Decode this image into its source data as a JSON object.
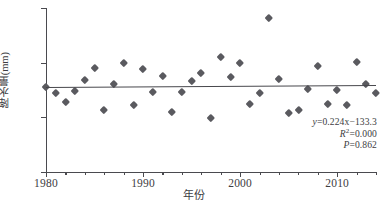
{
  "chart_data": {
    "type": "scatter",
    "title": "",
    "xlabel": "年份",
    "ylabel": "降水量(mm)",
    "xlim": [
      1980,
      2014
    ],
    "ylim": [
      0,
      600
    ],
    "xticks": [
      1980,
      1990,
      2000,
      2010
    ],
    "xtick_labels": [
      "1980",
      "1990",
      "2000",
      "2010"
    ],
    "xtick_minor_step": 2,
    "yticks": [
      0,
      200,
      400,
      600
    ],
    "ytick_labels": [
      "0",
      "200",
      "400",
      "600"
    ],
    "grid": false,
    "legend": "none",
    "marker": "diamond",
    "marker_color": "#5a5a5f",
    "line_color": "#47474c",
    "x": [
      1980,
      1981,
      1982,
      1983,
      1984,
      1985,
      1986,
      1987,
      1988,
      1989,
      1990,
      1991,
      1992,
      1993,
      1994,
      1995,
      1996,
      1997,
      1998,
      1999,
      2000,
      2001,
      2002,
      2003,
      2004,
      2005,
      2006,
      2007,
      2008,
      2009,
      2010,
      2011,
      2012,
      2013,
      2014
    ],
    "y": [
      311,
      288,
      256,
      297,
      335,
      382,
      228,
      321,
      400,
      245,
      376,
      293,
      351,
      218,
      294,
      332,
      361,
      196,
      421,
      348,
      398,
      248,
      288,
      565,
      340,
      214,
      228,
      303,
      387,
      250,
      300,
      244,
      404,
      321,
      287
    ],
    "annotations": {
      "equation_y": "y",
      "equation_rest": "=0.224x−133.3",
      "r_squared_label": "R",
      "r_squared_sup": "2",
      "r_squared_value": "=0.000",
      "p_label": "P",
      "p_value": "=0.862"
    },
    "regression": {
      "slope": 0.224,
      "intercept": -133.3,
      "r_squared": 0.0,
      "p_value": 0.862,
      "y_start": 310.2,
      "y_end": 317.8
    }
  }
}
